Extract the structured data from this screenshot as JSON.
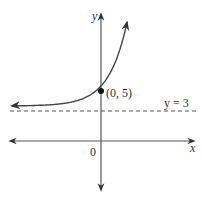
{
  "chart_data": {
    "type": "line",
    "title": "",
    "xlabel": "x",
    "ylabel": "y",
    "origin_label": "0",
    "function_description": "exponential growth curve with horizontal asymptote y = 3 passing through (0, 5)",
    "asymptote": {
      "y": 3,
      "label": "y = 3",
      "style": "dashed"
    },
    "marked_point": {
      "x": 0,
      "y": 5,
      "label": "(0, 5)"
    },
    "series": [
      {
        "name": "curve",
        "asymptote": 3,
        "y_intercept": 5
      }
    ],
    "colors": {
      "axis": "#333333",
      "curve": "#444444",
      "dashed": "#555555",
      "point": "#111111"
    }
  }
}
